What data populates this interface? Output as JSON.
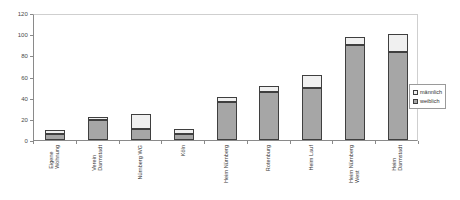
{
  "chart_data": {
    "type": "bar",
    "subtype": "stacked-vertical",
    "title": "",
    "subtitle": "",
    "xlabel": "",
    "ylabel": "",
    "ylim": [
      0,
      120
    ],
    "ytick_labels": [
      "0",
      "20",
      "40",
      "60",
      "80",
      "100",
      "120"
    ],
    "ytick_values": [
      0,
      20,
      40,
      60,
      80,
      100,
      120
    ],
    "grid": false,
    "legend_position": "right",
    "categories": [
      "Eigene Wohnung",
      "Verein Darmstadt",
      "Nürnberg WG",
      "Köln",
      "Heim Nürnberg",
      "Rotenburg",
      "Heim Lauf",
      "Heim Nürnberg West",
      "Heim Darmstadt"
    ],
    "category_lines": [
      [
        "Eigene",
        "Wohnung"
      ],
      [
        "Verein",
        "Darmstadt"
      ],
      [
        "Nürnberg WG"
      ],
      [
        "Köln"
      ],
      [
        "Heim Nürnberg"
      ],
      [
        "Rotenburg"
      ],
      [
        "Heim Lauf"
      ],
      [
        "Heim Nürnberg",
        "West"
      ],
      [
        "Heim",
        "Darmstadt"
      ]
    ],
    "series": [
      {
        "name": "weiblich",
        "color": "#a6a6a6",
        "values": [
          6,
          19,
          10,
          6,
          36,
          45,
          49,
          90,
          83
        ]
      },
      {
        "name": "männlich",
        "color": "#f0f0f0",
        "values": [
          3,
          3,
          15,
          4,
          5,
          6,
          12,
          7,
          17
        ]
      }
    ],
    "totals": [
      9,
      22,
      25,
      10,
      41,
      51,
      61,
      97,
      100
    ]
  },
  "legend": {
    "items": [
      {
        "label": "männlich",
        "color": "#f0f0f0"
      },
      {
        "label": "weiblich",
        "color": "#a6a6a6"
      }
    ]
  }
}
